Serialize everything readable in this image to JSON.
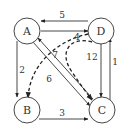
{
  "graph": {
    "nodes": [
      {
        "id": "A",
        "label": "A"
      },
      {
        "id": "B",
        "label": "B"
      },
      {
        "id": "C",
        "label": "C"
      },
      {
        "id": "D",
        "label": "D"
      }
    ],
    "edges": [
      {
        "from": "D",
        "to": "A",
        "weight": "5",
        "style": "solid"
      },
      {
        "from": "A",
        "to": "D",
        "weight": "",
        "style": "solid"
      },
      {
        "from": "A",
        "to": "B",
        "weight": "2",
        "style": "solid"
      },
      {
        "from": "A",
        "to": "C",
        "weight": "6",
        "style": "solid"
      },
      {
        "from": "C",
        "to": "A",
        "weight": "7",
        "style": "solid"
      },
      {
        "from": "B",
        "to": "C",
        "weight": "3",
        "style": "solid"
      },
      {
        "from": "D",
        "to": "C",
        "weight": "12",
        "style": "solid"
      },
      {
        "from": "C",
        "to": "D",
        "weight": "1",
        "style": "solid"
      },
      {
        "from": "D",
        "to": "B",
        "weight": "4",
        "style": "dashed"
      },
      {
        "from": "D",
        "to": "C",
        "weight": "",
        "style": "dashed"
      }
    ]
  }
}
